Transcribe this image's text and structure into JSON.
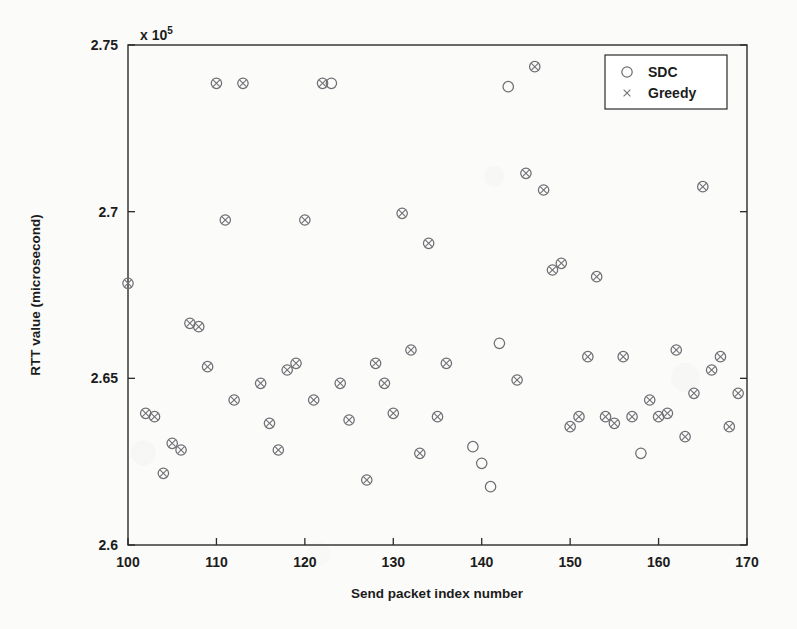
{
  "figure": {
    "axis_exponent_prefix": "x 10",
    "axis_exponent_power": "5",
    "xlabel": "Send packet index number",
    "ylabel": "RTT value (microsecond)",
    "xticks": [
      "100",
      "110",
      "120",
      "130",
      "140",
      "150",
      "160",
      "170"
    ],
    "yticks": [
      "2.6",
      "2.65",
      "2.7",
      "2.75"
    ],
    "marker_color": "#6e6e74",
    "axis_color": "#2b2b2b",
    "background": "#fbfbf9"
  },
  "legend": {
    "position": "top-right",
    "entries": [
      {
        "label": "SDC",
        "marker": "circle-marker"
      },
      {
        "label": "Greedy",
        "marker": "cross-marker"
      }
    ]
  },
  "chart_data": {
    "type": "scatter",
    "title": "",
    "xlabel": "Send packet index number",
    "ylabel": "RTT value (microsecond)",
    "y_axis_exponent": 100000,
    "xlim": [
      100,
      170
    ],
    "ylim": [
      2.6,
      2.75
    ],
    "xticks": [
      100,
      110,
      120,
      130,
      140,
      150,
      160,
      170
    ],
    "yticks": [
      2.6,
      2.65,
      2.7,
      2.75
    ],
    "grid": false,
    "legend_position": "top-right",
    "series": [
      {
        "name": "SDC",
        "marker": "circle",
        "points": [
          [
            100,
            2.6785
          ],
          [
            102,
            2.6395
          ],
          [
            103,
            2.6385
          ],
          [
            104,
            2.6215
          ],
          [
            105,
            2.6305
          ],
          [
            106,
            2.6285
          ],
          [
            107,
            2.6665
          ],
          [
            108,
            2.6655
          ],
          [
            109,
            2.6535
          ],
          [
            110,
            2.7385
          ],
          [
            111,
            2.6975
          ],
          [
            112,
            2.6435
          ],
          [
            113,
            2.7385
          ],
          [
            115,
            2.6485
          ],
          [
            116,
            2.6365
          ],
          [
            117,
            2.6285
          ],
          [
            118,
            2.6525
          ],
          [
            119,
            2.6545
          ],
          [
            120,
            2.6975
          ],
          [
            121,
            2.6435
          ],
          [
            122,
            2.7385
          ],
          [
            123,
            2.7385
          ],
          [
            124,
            2.6485
          ],
          [
            125,
            2.6375
          ],
          [
            127,
            2.6195
          ],
          [
            128,
            2.6545
          ],
          [
            129,
            2.6485
          ],
          [
            130,
            2.6395
          ],
          [
            131,
            2.6995
          ],
          [
            132,
            2.6585
          ],
          [
            133,
            2.6275
          ],
          [
            134,
            2.6905
          ],
          [
            135,
            2.6385
          ],
          [
            136,
            2.6545
          ],
          [
            139,
            2.6295
          ],
          [
            140,
            2.6245
          ],
          [
            141,
            2.6175
          ],
          [
            142,
            2.6605
          ],
          [
            143,
            2.7375
          ],
          [
            144,
            2.6495
          ],
          [
            145,
            2.7115
          ],
          [
            146,
            2.7435
          ],
          [
            147,
            2.7065
          ],
          [
            148,
            2.6825
          ],
          [
            149,
            2.6845
          ],
          [
            150,
            2.6355
          ],
          [
            151,
            2.6385
          ],
          [
            152,
            2.6565
          ],
          [
            153,
            2.6805
          ],
          [
            154,
            2.6385
          ],
          [
            155,
            2.6365
          ],
          [
            156,
            2.6565
          ],
          [
            157,
            2.6385
          ],
          [
            158,
            2.6275
          ],
          [
            159,
            2.6435
          ],
          [
            160,
            2.6385
          ],
          [
            161,
            2.6395
          ],
          [
            162,
            2.6585
          ],
          [
            163,
            2.6325
          ],
          [
            164,
            2.6455
          ],
          [
            165,
            2.7075
          ],
          [
            166,
            2.6525
          ],
          [
            167,
            2.6565
          ],
          [
            168,
            2.6355
          ],
          [
            169,
            2.6455
          ]
        ]
      },
      {
        "name": "Greedy",
        "marker": "x",
        "points": [
          [
            100,
            2.6785
          ],
          [
            102,
            2.6395
          ],
          [
            103,
            2.6385
          ],
          [
            104,
            2.6215
          ],
          [
            105,
            2.6305
          ],
          [
            106,
            2.6285
          ],
          [
            107,
            2.6665
          ],
          [
            108,
            2.6655
          ],
          [
            109,
            2.6535
          ],
          [
            110,
            2.7385
          ],
          [
            111,
            2.6975
          ],
          [
            112,
            2.6435
          ],
          [
            113,
            2.7385
          ],
          [
            115,
            2.6485
          ],
          [
            116,
            2.6365
          ],
          [
            117,
            2.6285
          ],
          [
            118,
            2.6525
          ],
          [
            119,
            2.6545
          ],
          [
            120,
            2.6975
          ],
          [
            121,
            2.6435
          ],
          [
            122,
            2.7385
          ],
          [
            124,
            2.6485
          ],
          [
            125,
            2.6375
          ],
          [
            127,
            2.6195
          ],
          [
            128,
            2.6545
          ],
          [
            129,
            2.6485
          ],
          [
            130,
            2.6395
          ],
          [
            131,
            2.6995
          ],
          [
            132,
            2.6585
          ],
          [
            133,
            2.6275
          ],
          [
            134,
            2.6905
          ],
          [
            135,
            2.6385
          ],
          [
            136,
            2.6545
          ],
          [
            144,
            2.6495
          ],
          [
            145,
            2.7115
          ],
          [
            146,
            2.7435
          ],
          [
            147,
            2.7065
          ],
          [
            148,
            2.6825
          ],
          [
            149,
            2.6845
          ],
          [
            150,
            2.6355
          ],
          [
            151,
            2.6385
          ],
          [
            152,
            2.6565
          ],
          [
            153,
            2.6805
          ],
          [
            154,
            2.6385
          ],
          [
            155,
            2.6365
          ],
          [
            156,
            2.6565
          ],
          [
            157,
            2.6385
          ],
          [
            159,
            2.6435
          ],
          [
            160,
            2.6385
          ],
          [
            161,
            2.6395
          ],
          [
            162,
            2.6585
          ],
          [
            163,
            2.6325
          ],
          [
            164,
            2.6455
          ],
          [
            165,
            2.7075
          ],
          [
            166,
            2.6525
          ],
          [
            167,
            2.6565
          ],
          [
            168,
            2.6355
          ],
          [
            169,
            2.6455
          ]
        ]
      }
    ]
  }
}
